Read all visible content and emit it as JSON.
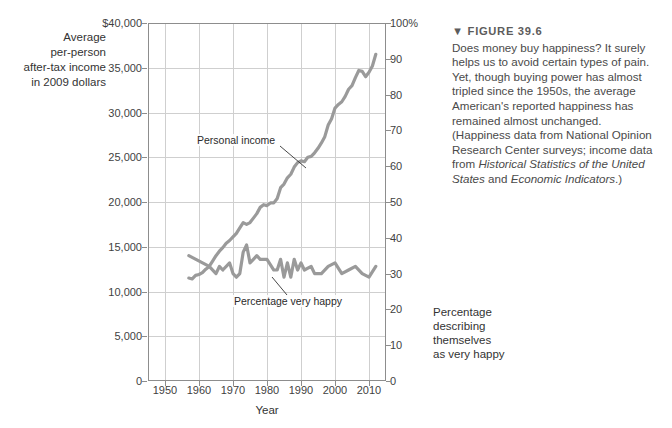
{
  "figure": {
    "marker": "▼",
    "number": "FIGURE 39.6",
    "caption_part1": "Does money buy happiness? It surely helps us to avoid certain types of pain. Yet, though buying power has almost tripled since the 1950s, the average American's reported happiness has remained almost unchanged. (Happiness data from National Opinion Research Center surveys; income data from ",
    "caption_italic1": "Historical Statistics of the United States",
    "caption_mid": " and ",
    "caption_italic2": "Economic Indicators",
    "caption_end": ".)"
  },
  "axis_left_title": {
    "line1": "Average",
    "line2": "per-person",
    "line3": "after-tax income",
    "line4": "in 2009 dollars"
  },
  "axis_right_title": {
    "line1": "Percentage",
    "line2": "describing",
    "line3": "themselves",
    "line4": "as very happy"
  },
  "annotations": {
    "income": "Personal income",
    "happiness": "Percentage very happy"
  },
  "colors": {
    "line": "#9a9a9a",
    "grid": "#cfcfcf",
    "frame": "#8d8d8d",
    "text": "#3a3a3a",
    "caption": "#4a4a4a"
  },
  "chart_data": {
    "type": "line",
    "title": "Does money buy happiness?",
    "xlabel": "Year",
    "ylabel": "Average per-person after-tax income in 2009 dollars",
    "y2label": "Percentage describing themselves as very happy",
    "xlim": [
      1945,
      2015
    ],
    "ylim": [
      0,
      40000
    ],
    "y2lim": [
      0,
      100
    ],
    "grid": true,
    "legend": "inline-annotations",
    "xticks": [
      1950,
      1960,
      1970,
      1980,
      1990,
      2000,
      2010
    ],
    "xtick_labels": [
      "1950",
      "1960",
      "1970",
      "1980",
      "1990",
      "2000",
      "2010"
    ],
    "yticks": [
      0,
      5000,
      10000,
      15000,
      20000,
      25000,
      30000,
      35000,
      40000
    ],
    "ytick_labels": [
      "0",
      "5,000",
      "10,000",
      "15,000",
      "20,000",
      "25,000",
      "30,000",
      "35,000",
      "$40,000"
    ],
    "y2ticks": [
      0,
      10,
      20,
      30,
      40,
      50,
      60,
      70,
      80,
      90,
      100
    ],
    "y2tick_labels": [
      "0",
      "10",
      "20",
      "30",
      "40",
      "50",
      "60",
      "70",
      "80",
      "90",
      "100%"
    ],
    "series": [
      {
        "name": "Personal income",
        "axis": "left",
        "units": "2009 dollars",
        "x": [
          1957,
          1958,
          1959,
          1960,
          1961,
          1962,
          1963,
          1964,
          1965,
          1966,
          1967,
          1968,
          1969,
          1970,
          1971,
          1972,
          1973,
          1974,
          1975,
          1976,
          1977,
          1978,
          1979,
          1980,
          1981,
          1982,
          1983,
          1984,
          1985,
          1986,
          1987,
          1988,
          1989,
          1990,
          1991,
          1992,
          1993,
          1994,
          1995,
          1996,
          1997,
          1998,
          1999,
          2000,
          2001,
          2002,
          2003,
          2004,
          2005,
          2006,
          2007,
          2008,
          2009,
          2010,
          2011,
          2012
        ],
        "values": [
          11500,
          11400,
          11800,
          11900,
          12100,
          12500,
          12800,
          13400,
          14000,
          14500,
          14900,
          15400,
          15700,
          16100,
          16500,
          17100,
          17700,
          17500,
          17700,
          18200,
          18700,
          19400,
          19700,
          19600,
          19900,
          19900,
          20400,
          21600,
          22000,
          22700,
          23100,
          23900,
          24400,
          24600,
          24500,
          25000,
          25100,
          25500,
          26000,
          26600,
          27300,
          28600,
          29300,
          30500,
          30900,
          31200,
          31800,
          32600,
          33000,
          33900,
          34700,
          34600,
          34000,
          34500,
          35200,
          36500
        ]
      },
      {
        "name": "Percentage very happy",
        "axis": "right",
        "units": "percent",
        "x": [
          1957,
          1963,
          1965,
          1966,
          1967,
          1969,
          1970,
          1971,
          1972,
          1973,
          1974,
          1975,
          1976,
          1977,
          1978,
          1980,
          1982,
          1983,
          1984,
          1985,
          1986,
          1987,
          1988,
          1989,
          1990,
          1991,
          1993,
          1994,
          1996,
          1998,
          2000,
          2002,
          2004,
          2006,
          2008,
          2010,
          2012
        ],
        "values": [
          35,
          32,
          30,
          32,
          31,
          33,
          30,
          29,
          30,
          36,
          38,
          33,
          34,
          35,
          34,
          34,
          31,
          31,
          34,
          29,
          33,
          29,
          34,
          31,
          33,
          31,
          32,
          30,
          30,
          32,
          33,
          30,
          31,
          32,
          30,
          29,
          32
        ]
      }
    ],
    "annotations": [
      {
        "text": "Personal income",
        "points_to_series": "Personal income",
        "near_year": 1988
      },
      {
        "text": "Percentage very happy",
        "points_to_series": "Percentage very happy",
        "near_year": 1983
      }
    ]
  }
}
